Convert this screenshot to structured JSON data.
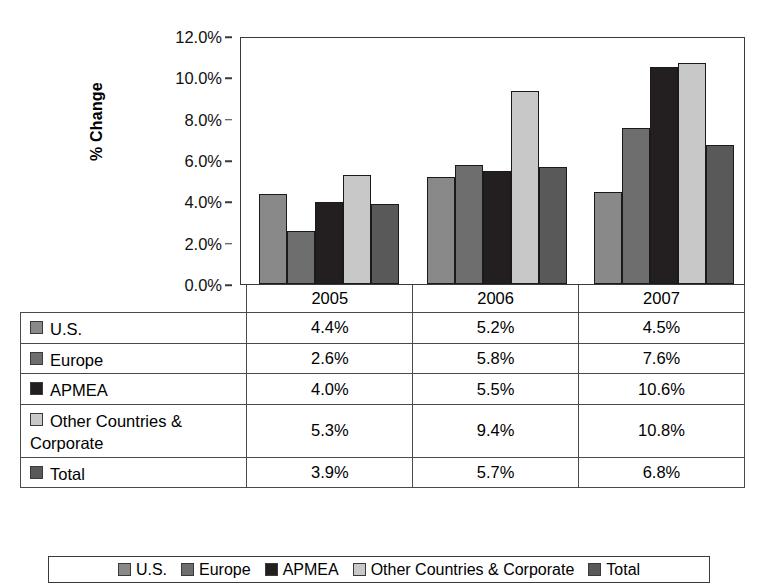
{
  "chart_data": {
    "type": "bar",
    "title": "",
    "xlabel": "",
    "ylabel": "% Change",
    "ylim": [
      0,
      12
    ],
    "ytick_labels": [
      "0.0%",
      "2.0%",
      "4.0%",
      "6.0%",
      "8.0%",
      "10.0%",
      "12.0%"
    ],
    "ytick_values": [
      0,
      2,
      4,
      6,
      8,
      10,
      12
    ],
    "grid": false,
    "legend_position": "bottom",
    "categories": [
      "2005",
      "2006",
      "2007"
    ],
    "series": [
      {
        "name": "U.S.",
        "color": "#898989",
        "values": [
          4.4,
          5.2,
          4.5
        ],
        "labels": [
          "4.4%",
          "5.2%",
          "4.5%"
        ]
      },
      {
        "name": "Europe",
        "color": "#6e6e6e",
        "values": [
          2.6,
          5.8,
          7.6
        ],
        "labels": [
          "2.6%",
          "5.8%",
          "7.6%"
        ]
      },
      {
        "name": "APMEA",
        "color": "#231f20",
        "values": [
          4.0,
          5.5,
          10.6
        ],
        "labels": [
          "4.0%",
          "5.5%",
          "10.6%"
        ]
      },
      {
        "name": "Other Countries & Corporate",
        "color": "#c8c8c8",
        "values": [
          5.3,
          9.4,
          10.8
        ],
        "labels": [
          "5.3%",
          "9.4%",
          "10.8%"
        ]
      },
      {
        "name": "Total",
        "color": "#595959",
        "values": [
          3.9,
          5.7,
          6.8
        ],
        "labels": [
          "3.9%",
          "5.7%",
          "6.8%"
        ]
      }
    ]
  },
  "table": {
    "year_headers": [
      "2005",
      "2006",
      "2007"
    ],
    "rows": [
      {
        "label": "U.S.",
        "color": "#898989",
        "values": [
          "4.4%",
          "5.2%",
          "4.5%"
        ]
      },
      {
        "label": "Europe",
        "color": "#6e6e6e",
        "values": [
          "2.6%",
          "5.8%",
          "7.6%"
        ]
      },
      {
        "label": "APMEA",
        "color": "#231f20",
        "values": [
          "4.0%",
          "5.5%",
          "10.6%"
        ]
      },
      {
        "label": "Other Countries & Corporate",
        "color": "#c8c8c8",
        "values": [
          "5.3%",
          "9.4%",
          "10.8%"
        ]
      },
      {
        "label": "Total",
        "color": "#595959",
        "values": [
          "3.9%",
          "5.7%",
          "6.8%"
        ]
      }
    ]
  },
  "legend": {
    "items": [
      {
        "label": "U.S.",
        "color": "#898989"
      },
      {
        "label": "Europe",
        "color": "#6e6e6e"
      },
      {
        "label": "APMEA",
        "color": "#231f20"
      },
      {
        "label": "Other Countries & Corporate",
        "color": "#c8c8c8"
      },
      {
        "label": "Total",
        "color": "#595959"
      }
    ]
  }
}
